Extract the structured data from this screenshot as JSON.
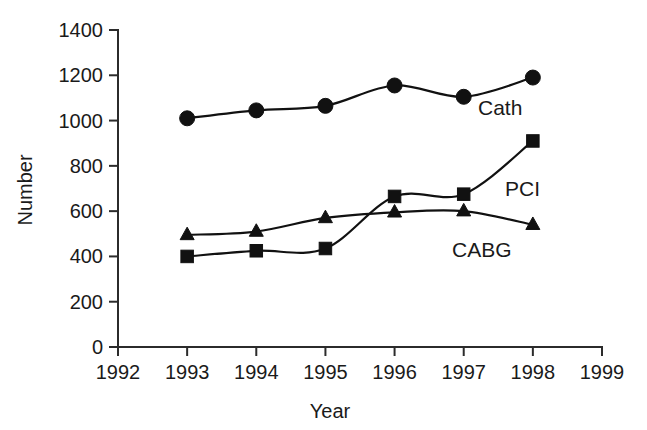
{
  "chart_data": {
    "type": "line",
    "title": "",
    "xlabel": "Year",
    "ylabel": "Number",
    "x": [
      1993,
      1994,
      1995,
      1996,
      1997,
      1998
    ],
    "xlim": [
      1992,
      1999
    ],
    "ylim": [
      0,
      1400
    ],
    "xticks": [
      "1992",
      "1993",
      "1994",
      "1995",
      "1996",
      "1997",
      "1998",
      "1999"
    ],
    "yticks": [
      "0",
      "200",
      "400",
      "600",
      "800",
      "1000",
      "1200",
      "1400"
    ],
    "grid": false,
    "legend_position": "inline-right",
    "series": [
      {
        "name": "Cath",
        "marker": "circle",
        "color": "#111111",
        "values": [
          1010,
          1045,
          1065,
          1155,
          1105,
          1190
        ]
      },
      {
        "name": "PCI",
        "marker": "square",
        "color": "#111111",
        "values": [
          400,
          425,
          435,
          665,
          675,
          910
        ]
      },
      {
        "name": "CABG",
        "marker": "triangle",
        "color": "#111111",
        "values": [
          495,
          510,
          570,
          595,
          600,
          540
        ]
      }
    ],
    "annotations": [
      {
        "text": "Cath",
        "series": "Cath"
      },
      {
        "text": "PCI",
        "series": "PCI"
      },
      {
        "text": "CABG",
        "series": "CABG"
      }
    ]
  }
}
